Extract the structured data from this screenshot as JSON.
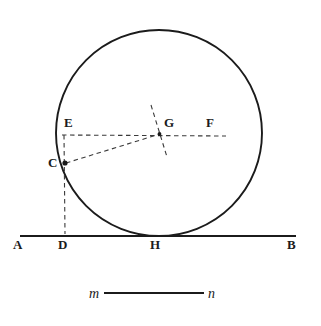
{
  "figure": {
    "kind": "geometry-construction-diagram",
    "caption": "",
    "background_color": "#ffffff",
    "ink_color": "#1b1b1b",
    "labels": {
      "A": "A",
      "B": "B",
      "C": "C",
      "D": "D",
      "E": "E",
      "F": "F",
      "G": "G",
      "H": "H",
      "m": "m",
      "n": "n"
    },
    "points": {
      "A": {
        "x": 20,
        "y": 236,
        "label_x": 13,
        "label_y": 238
      },
      "B": {
        "x": 296,
        "y": 236,
        "label_x": 287,
        "label_y": 238
      },
      "C": {
        "x": 65,
        "y": 163,
        "label_x": 48,
        "label_y": 157
      },
      "D": {
        "x": 65,
        "y": 236,
        "label_x": 58,
        "label_y": 238
      },
      "E": {
        "x": 63,
        "y": 135,
        "label_x": 64,
        "label_y": 116
      },
      "F": {
        "x": 225,
        "y": 135,
        "label_x": 206,
        "label_y": 116
      },
      "G": {
        "x": 159,
        "y": 134,
        "label_x": 164,
        "label_y": 116
      },
      "H": {
        "x": 157,
        "y": 236,
        "label_x": 150,
        "label_y": 238
      },
      "m": {
        "label_x": 89,
        "label_y": 288
      },
      "n": {
        "label_x": 208,
        "label_y": 288
      }
    },
    "circle": {
      "center_x": 159,
      "center_y": 133,
      "radius": 103,
      "stroke_color": "#1b1b1b",
      "stroke_width": 1.9
    },
    "baseline": {
      "name": "line-AB",
      "x1": 20,
      "y1": 236,
      "x2": 296,
      "y2": 236,
      "stroke_width": 1.9
    },
    "segment_mn": {
      "name": "segment-mn",
      "x1": 104,
      "y1": 293,
      "x2": 204,
      "y2": 293,
      "stroke_width": 1.9
    },
    "dashed_lines": [
      {
        "name": "dashed-line-EF",
        "x1": 62,
        "y1": 135,
        "x2": 226,
        "y2": 136
      },
      {
        "name": "dashed-line-ECD",
        "x1": 64,
        "y1": 135,
        "x2": 65,
        "y2": 234
      },
      {
        "name": "dashed-line-CG",
        "x1": 66,
        "y1": 163,
        "x2": 160,
        "y2": 134
      },
      {
        "name": "dashed-line-oblique-through-G",
        "x1": 151,
        "y1": 105,
        "x2": 167,
        "y2": 157
      }
    ],
    "markers": [
      {
        "name": "point-marker-C",
        "x": 65,
        "y": 163,
        "r": 2.6
      },
      {
        "name": "point-marker-G",
        "x": 159.5,
        "y": 134,
        "r": 1.9
      }
    ]
  }
}
